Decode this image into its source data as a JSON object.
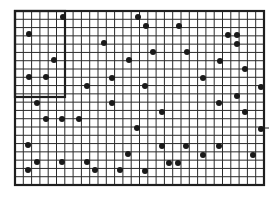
{
  "figure": {
    "colors": {
      "background": "#ffffff",
      "grid": "#2a2a2a",
      "border": "#1e1e1e",
      "dot": "#1a1a1a"
    },
    "grid": {
      "x0": 15,
      "y0": 11,
      "x1": 264,
      "y1": 185,
      "columns": 30,
      "rows": 21
    },
    "inset_rect": {
      "x0": 15,
      "y0": 11,
      "x1": 65,
      "y1": 97
    },
    "edge_tick": {
      "x": 264,
      "y": 128,
      "length": 5
    },
    "dots": [
      [
        63,
        17
      ],
      [
        29,
        34
      ],
      [
        54,
        60
      ],
      [
        29,
        77
      ],
      [
        46,
        77
      ],
      [
        138,
        17
      ],
      [
        146,
        26
      ],
      [
        104,
        43
      ],
      [
        153,
        52
      ],
      [
        129,
        60
      ],
      [
        112,
        78
      ],
      [
        87,
        86
      ],
      [
        145,
        86
      ],
      [
        179,
        26
      ],
      [
        228,
        35
      ],
      [
        237,
        35
      ],
      [
        237,
        44
      ],
      [
        187,
        52
      ],
      [
        220,
        61
      ],
      [
        245,
        69
      ],
      [
        203,
        78
      ],
      [
        261,
        87
      ],
      [
        237,
        96
      ],
      [
        37,
        103
      ],
      [
        112,
        103
      ],
      [
        46,
        119
      ],
      [
        62,
        119
      ],
      [
        79,
        119
      ],
      [
        137,
        128
      ],
      [
        28,
        145
      ],
      [
        128,
        154
      ],
      [
        37,
        162
      ],
      [
        62,
        162
      ],
      [
        87,
        162
      ],
      [
        28,
        170
      ],
      [
        95,
        170
      ],
      [
        120,
        170
      ],
      [
        219,
        103
      ],
      [
        162,
        112
      ],
      [
        245,
        112
      ],
      [
        261,
        129
      ],
      [
        162,
        146
      ],
      [
        186,
        146
      ],
      [
        219,
        146
      ],
      [
        203,
        155
      ],
      [
        253,
        155
      ],
      [
        169,
        163
      ],
      [
        178,
        163
      ],
      [
        145,
        171
      ]
    ]
  }
}
